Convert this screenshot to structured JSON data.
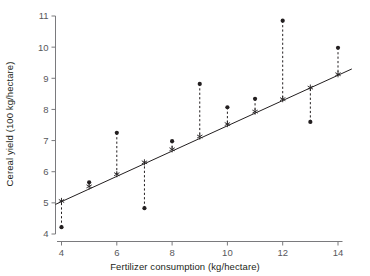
{
  "chart_data": {
    "type": "scatter",
    "title": "",
    "xlabel": "Fertilizer consumption (kg/hectare)",
    "ylabel": "Cereal yield (100 kg/hectare)",
    "xlim": [
      3.6,
      14.6
    ],
    "ylim": [
      4,
      11
    ],
    "xticks": [
      4,
      6,
      8,
      10,
      12,
      14
    ],
    "xtick_labels": [
      "4",
      "6",
      "8",
      "10",
      "12",
      "14"
    ],
    "yticks": [
      4,
      5,
      6,
      7,
      8,
      9,
      10,
      11
    ],
    "ytick_labels": [
      "4",
      "5",
      "6",
      "7",
      "8",
      "9",
      "10",
      "11"
    ],
    "grid": false,
    "legend": "none",
    "x": [
      4,
      5,
      6,
      7,
      8,
      9,
      10,
      11,
      12,
      13,
      14
    ],
    "observed": [
      4.22,
      5.66,
      7.25,
      4.83,
      6.98,
      8.82,
      8.07,
      8.34,
      10.85,
      7.6,
      9.98
    ],
    "fitted": [
      5.06,
      5.53,
      5.92,
      6.3,
      6.72,
      7.13,
      7.53,
      7.93,
      8.33,
      8.7,
      9.13
    ],
    "series": [
      {
        "name": "Observed cereal yield",
        "marker": "filled-circle",
        "values": [
          4.22,
          5.66,
          7.25,
          4.83,
          6.98,
          8.82,
          8.07,
          8.34,
          10.85,
          7.6,
          9.98
        ]
      },
      {
        "name": "Fitted value on regression line",
        "marker": "star",
        "values": [
          5.06,
          5.53,
          5.92,
          6.3,
          6.72,
          7.13,
          7.53,
          7.93,
          8.33,
          8.7,
          9.13
        ]
      }
    ],
    "regression_line": {
      "x_start": 3.78,
      "y_start": 4.95,
      "x_end": 14.5,
      "y_end": 9.3
    },
    "residual_connectors": true,
    "colors": {
      "marker": "#231f20",
      "line": "#231f20",
      "axis": "#7a7a7d",
      "tick_label": "#58585b",
      "background": "#ffffff"
    }
  }
}
